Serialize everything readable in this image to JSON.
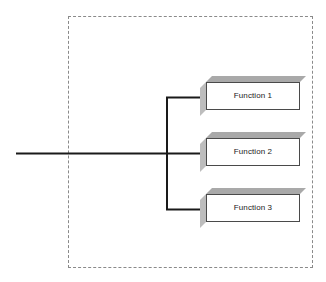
{
  "diagram": {
    "boundary": {
      "name": "system-boundary",
      "style": "dashed",
      "color": "#8a8a8a"
    },
    "input_line": {
      "name": "input-signal-line",
      "color": "#1a1a1a"
    },
    "bus": {
      "name": "distribution-bus",
      "color": "#1a1a1a"
    },
    "blocks": [
      {
        "id": "function-1",
        "label": "Function 1",
        "face_color": "#ffffff",
        "edge_color": "#4a4a4a",
        "top_color": "#a9a9a9",
        "side_color": "#bdbdbd"
      },
      {
        "id": "function-2",
        "label": "Function 2",
        "face_color": "#ffffff",
        "edge_color": "#4a4a4a",
        "top_color": "#a9a9a9",
        "side_color": "#bdbdbd"
      },
      {
        "id": "function-3",
        "label": "Function 3",
        "face_color": "#ffffff",
        "edge_color": "#4a4a4a",
        "top_color": "#a9a9a9",
        "side_color": "#bdbdbd"
      }
    ]
  }
}
